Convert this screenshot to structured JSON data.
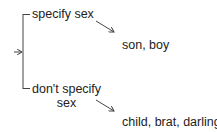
{
  "diagram": {
    "type": "bracket-choice",
    "options": [
      {
        "label": "specify sex",
        "result": "son, boy"
      },
      {
        "label_line1": "don't specify",
        "label_line2": "sex",
        "result": "child, brat, darling"
      }
    ],
    "colors": {
      "line": "#444444",
      "text": "#222222",
      "background": "#ffffff"
    }
  }
}
